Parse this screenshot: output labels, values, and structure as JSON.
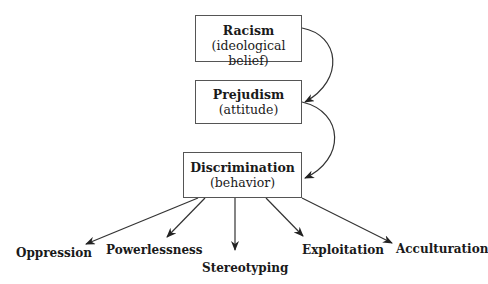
{
  "diagram": {
    "nodes": [
      {
        "id": "racism",
        "title": "Racism",
        "subtitle": "(ideological belief)"
      },
      {
        "id": "prejudism",
        "title": "Prejudism",
        "subtitle": "(attitude)"
      },
      {
        "id": "discrimination",
        "title": "Discrimination",
        "subtitle": "(behavior)"
      }
    ],
    "outcomes": [
      "Oppression",
      "Powerlessness",
      "Stereotyping",
      "Exploitation",
      "Acculturation"
    ],
    "edges": [
      {
        "from": "racism",
        "to": "prejudism"
      },
      {
        "from": "prejudism",
        "to": "discrimination"
      },
      {
        "from": "discrimination",
        "to": "Oppression"
      },
      {
        "from": "discrimination",
        "to": "Powerlessness"
      },
      {
        "from": "discrimination",
        "to": "Stereotyping"
      },
      {
        "from": "discrimination",
        "to": "Exploitation"
      },
      {
        "from": "discrimination",
        "to": "Acculturation"
      }
    ]
  }
}
